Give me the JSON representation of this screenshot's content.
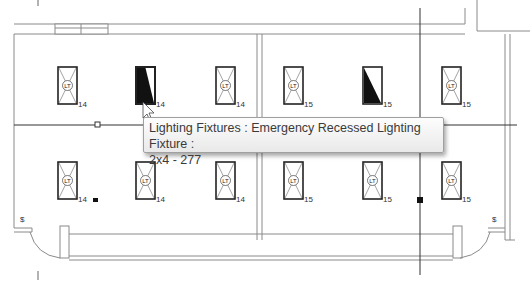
{
  "view": {
    "type": "floor-plan-lighting",
    "colors": {
      "line": "#555555",
      "wall": "#8a8a8a",
      "gridline": "#333333",
      "background": "#ffffff"
    }
  },
  "fixtures": [
    {
      "id": "f1",
      "x": 58,
      "y": 67,
      "tag": "14",
      "highlighted": false,
      "style": "x"
    },
    {
      "id": "f2",
      "x": 136,
      "y": 67,
      "tag": "14",
      "highlighted": true,
      "style": "solid"
    },
    {
      "id": "f3",
      "x": 216,
      "y": 67,
      "tag": "14",
      "highlighted": false,
      "style": "x"
    },
    {
      "id": "f4",
      "x": 284,
      "y": 67,
      "tag": "15",
      "highlighted": false,
      "style": "x"
    },
    {
      "id": "f5",
      "x": 363,
      "y": 67,
      "tag": "15",
      "highlighted": false,
      "style": "half"
    },
    {
      "id": "f6",
      "x": 442,
      "y": 67,
      "tag": "15",
      "highlighted": false,
      "style": "x"
    },
    {
      "id": "f7",
      "x": 58,
      "y": 162,
      "tag": "14",
      "highlighted": false,
      "style": "x"
    },
    {
      "id": "f8",
      "x": 136,
      "y": 162,
      "tag": "14",
      "highlighted": false,
      "style": "x"
    },
    {
      "id": "f9",
      "x": 216,
      "y": 162,
      "tag": "14",
      "highlighted": false,
      "style": "x"
    },
    {
      "id": "f10",
      "x": 284,
      "y": 162,
      "tag": "15",
      "highlighted": false,
      "style": "x"
    },
    {
      "id": "f11",
      "x": 363,
      "y": 162,
      "tag": "15",
      "highlighted": false,
      "style": "x"
    },
    {
      "id": "f12",
      "x": 442,
      "y": 162,
      "tag": "15",
      "highlighted": false,
      "style": "x"
    }
  ],
  "fixture_symbol_label": "LT",
  "tooltip": {
    "line1": "Lighting Fixtures : Emergency Recessed Lighting Fixture :",
    "line2": "2x4 - 277"
  }
}
